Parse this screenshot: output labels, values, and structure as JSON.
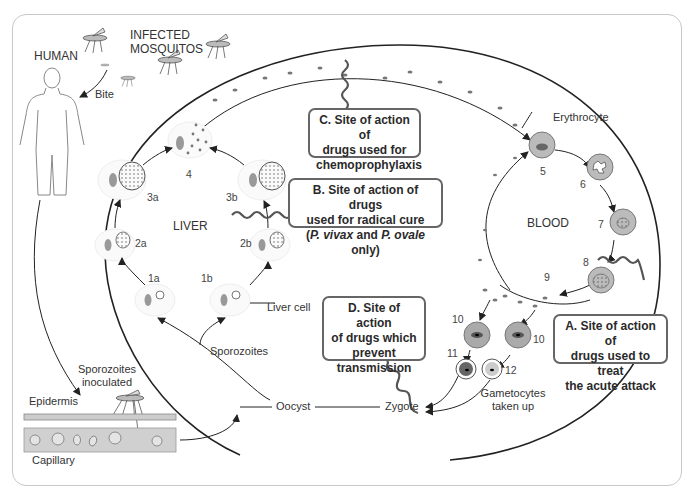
{
  "title_labels": {
    "human": "HUMAN",
    "infected_mosquitos_line1": "INFECTED",
    "infected_mosquitos_line2": "MOSQUITOS",
    "bite": "Bite"
  },
  "regions": {
    "liver": "LIVER",
    "blood": "BLOOD"
  },
  "stage_labels": {
    "erythrocyte": "Erythrocyte",
    "liver_cell": "Liver cell",
    "sporozoites": "Sporozoites",
    "sporozoites_inoculated_line1": "Sporozoites",
    "sporozoites_inoculated_line2": "inoculated",
    "epidermis": "Epidermis",
    "capillary": "Capillary",
    "oocyst": "Oocyst",
    "zygote": "Zygote",
    "gametocytes_line1": "Gametocytes",
    "gametocytes_line2": "taken up"
  },
  "stage_numbers": {
    "n1a": "1a",
    "n1b": "1b",
    "n2a": "2a",
    "n2b": "2b",
    "n3a": "3a",
    "n3b": "3b",
    "n4": "4",
    "n5": "5",
    "n6": "6",
    "n7": "7",
    "n8": "8",
    "n9": "9",
    "n10a": "10",
    "n10b": "10",
    "n11": "11",
    "n12": "12"
  },
  "drug_sites": {
    "A": {
      "line1": "A.  Site of action of",
      "line2": "drugs used to treat",
      "line3": "the acute attack"
    },
    "B": {
      "line1": "B.  Site of action of drugs",
      "line2": "used for radical cure",
      "line3_open": "(",
      "line3_sp1": "P. vivax",
      "line3_and": " and ",
      "line3_sp2": "P. ovale",
      "line3_close": " only)"
    },
    "C": {
      "line1": "C.  Site of action of",
      "line2": "drugs used for",
      "line3": "chemoprophylaxis"
    },
    "D": {
      "line1": "D.  Site of action",
      "line2": "of drugs which",
      "line3": "prevent",
      "line4": "transmission"
    }
  },
  "colors": {
    "line": "#222222",
    "box_border": "#666666",
    "cell_fill": "#9a9a9a",
    "nucleus": "#888888",
    "frame": "#c8c8c8"
  }
}
